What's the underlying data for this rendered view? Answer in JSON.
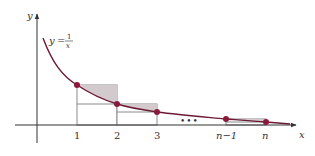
{
  "diagram": {
    "curve_label": {
      "lhs": "y",
      "eq": "=",
      "numerator": "1",
      "denominator": "x"
    },
    "axes": {
      "x_label": "x",
      "y_label": "y"
    },
    "ticks": [
      {
        "label": "1",
        "italic": false
      },
      {
        "label": "2",
        "italic": false
      },
      {
        "label": "3",
        "italic": false
      },
      {
        "label": "n−1",
        "italic": true
      },
      {
        "label": "n",
        "italic": true
      }
    ],
    "ellipsis": "•••",
    "colors": {
      "curve": "#6b1a34",
      "point": "#8a1a3c",
      "rect_fill": "#d9d4d6",
      "rect_stroke": "#8a8a8a",
      "axis": "#333333",
      "shaded_region": "#cfc6ca"
    }
  }
}
